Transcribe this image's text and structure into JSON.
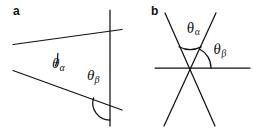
{
  "figure": {
    "width": 253,
    "height": 130,
    "background_color": "#ffffff",
    "line_color": "#111111"
  },
  "panels": [
    {
      "id": "a",
      "letter": "a",
      "labels": [
        {
          "id": "a-theta-alpha",
          "symbol": "θ",
          "subscript": "α",
          "text": "θα"
        },
        {
          "id": "a-theta-beta",
          "symbol": "θ",
          "subscript": "β",
          "text": "θβ"
        }
      ]
    },
    {
      "id": "b",
      "letter": "b",
      "labels": [
        {
          "id": "b-theta-alpha",
          "symbol": "θ",
          "subscript": "α",
          "text": "θα"
        },
        {
          "id": "b-theta-beta",
          "symbol": "θ",
          "subscript": "β",
          "text": "θβ"
        }
      ]
    }
  ],
  "geometry": {
    "panel_a": {
      "vertex": [
        32,
        57
      ],
      "upper_ray": {
        "from": [
          14,
          45
        ],
        "to": [
          122,
          30
        ]
      },
      "lower_ray": {
        "from": [
          14,
          71
        ],
        "to": [
          122,
          110
        ]
      },
      "vertical_line": {
        "from": [
          110,
          10
        ],
        "to": [
          110,
          126
        ]
      },
      "arc_alpha": {
        "center": [
          32,
          57
        ],
        "radius": 26
      },
      "arc_beta": {
        "center": [
          110,
          103
        ],
        "radius": 17
      }
    },
    "panel_b": {
      "vertex": [
        190,
        68
      ],
      "line_1": {
        "from": [
          164,
          14
        ],
        "to": [
          216,
          126
        ]
      },
      "line_2": {
        "from": [
          216,
          14
        ],
        "to": [
          164,
          126
        ]
      },
      "horizontal_line": {
        "from": [
          155,
          68
        ],
        "to": [
          250,
          68
        ]
      },
      "arc_alpha": {
        "center": [
          190,
          68
        ],
        "radius": 24
      },
      "arc_beta": {
        "center": [
          190,
          68
        ],
        "radius": 21
      }
    }
  }
}
